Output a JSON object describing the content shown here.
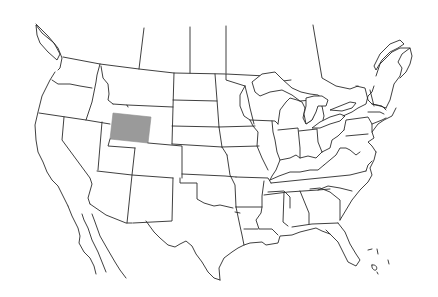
{
  "map": {
    "title": "United States outline map",
    "region": "Contiguous United States with Canada and Mexico borders",
    "highlighted_state": "Wyoming",
    "colors": {
      "background": "#ffffff",
      "outline": "#2a2a2a",
      "highlight_fill": "#9a9a9a"
    },
    "labels_visible": false
  }
}
